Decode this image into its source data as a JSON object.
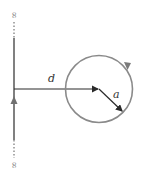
{
  "diagram": {
    "type": "wire-and-loop",
    "labels": {
      "distance": "d",
      "radius": "a",
      "top_end": "∞",
      "bottom_end": "∞"
    },
    "colors": {
      "wire": "#808080",
      "loop": "#8a8a8a",
      "vector": "#2a2a2a",
      "background": "#ffffff"
    }
  }
}
